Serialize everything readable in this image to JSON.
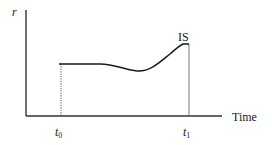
{
  "diagram": {
    "y_axis_label": "r",
    "x_axis_label": "Time",
    "curve_end_label": "IS",
    "tick_t0": {
      "base": "t",
      "sub": "0"
    },
    "tick_t1": {
      "base": "t",
      "sub": "1"
    }
  },
  "colors": {
    "line": "#1a1a1a",
    "axis": "#333333",
    "dotted": "#555555",
    "background": "#ffffff"
  }
}
